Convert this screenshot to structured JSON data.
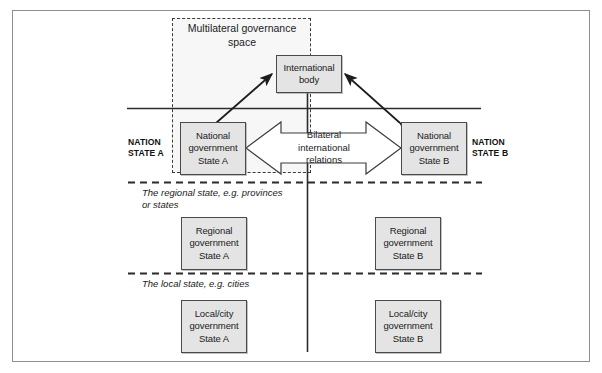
{
  "diagram": {
    "title_region": {
      "multilateral_space_label": "Multilateral governance\nspace"
    },
    "nodes": {
      "international_body": "International\nbody",
      "national_gov_a": "National\ngovernment\nState A",
      "national_gov_b": "National\ngovernment\nState B",
      "regional_gov_a": "Regional\ngovernment\nState A",
      "regional_gov_b": "Regional\ngovernment\nState B",
      "local_gov_a": "Local/city\ngovernment\nState A",
      "local_gov_b": "Local/city\ngovernment\nState B"
    },
    "connector_labels": {
      "bilateral": "Bilateral\ninternational\nrelations"
    },
    "side_labels": {
      "nation_state_a": "NATION\nSTATE A",
      "nation_state_b": "NATION\nSTATE B"
    },
    "zone_labels": {
      "regional": "The regional state, e.g. provinces\nor states",
      "local": "The local state, e.g. cities"
    },
    "colors": {
      "node_fill": "#e4e4e4",
      "node_border": "#4a4a4a",
      "line": "#2c2c2c",
      "page_frame": "#8e8e8e",
      "governance_fill": "#f0f0f0"
    }
  }
}
